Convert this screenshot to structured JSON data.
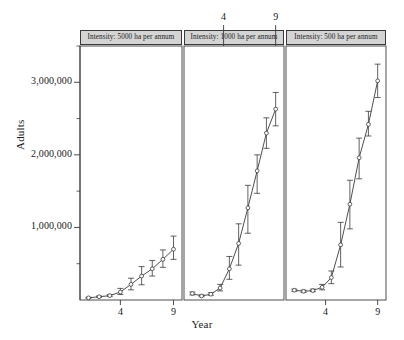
{
  "figure": {
    "axis_titles": {
      "y": "Adults",
      "x": "Year"
    },
    "colors": {
      "line": "#3a3a3a",
      "strip_fill": "#d4d4d4",
      "strip_border": "#3a3a3a",
      "text": "#1a1a1a"
    }
  },
  "chart_data": {
    "type": "line",
    "title": "",
    "xlabel": "Year",
    "ylabel": "Adults",
    "xlim": [
      0.2,
      9.8
    ],
    "ylim": [
      0,
      3500000
    ],
    "grid": false,
    "legend": "none",
    "layout": "3 panels side by side (trellis), shared y-axis",
    "error_bars": true,
    "marker": "open circle",
    "xticks": [
      4,
      9
    ],
    "xtick_labels": [
      "4",
      "9"
    ],
    "xtick_side_per_panel": [
      "bottom",
      "top",
      "bottom"
    ],
    "yticks": [
      1000000,
      2000000,
      3000000
    ],
    "ytick_labels": [
      "1,000,000",
      "2,000,000",
      "3,000,000"
    ],
    "yminor_ticks": [
      500000,
      1500000,
      2500000,
      3500000
    ],
    "panels": [
      {
        "strip_label": "Intensity: 5000 ha per annum",
        "x": [
          1,
          2,
          3,
          4,
          5,
          6,
          7,
          8,
          9
        ],
        "y": [
          30000,
          45000,
          60000,
          110000,
          215000,
          330000,
          430000,
          560000,
          700000
        ],
        "y_lower": [
          25000,
          38000,
          50000,
          75000,
          140000,
          210000,
          330000,
          450000,
          560000
        ],
        "y_upper": [
          38000,
          55000,
          75000,
          160000,
          300000,
          460000,
          545000,
          690000,
          880000
        ]
      },
      {
        "strip_label": "Intensity: 1000 ha per annum",
        "x": [
          1,
          2,
          3,
          4,
          5,
          6,
          7,
          8,
          9
        ],
        "y": [
          90000,
          55000,
          80000,
          165000,
          430000,
          780000,
          1270000,
          1780000,
          2300000,
          2630000
        ],
        "y_lower": [
          70000,
          45000,
          65000,
          125000,
          285000,
          480000,
          920000,
          1470000,
          2090000,
          2400000
        ],
        "y_upper": [
          110000,
          70000,
          100000,
          215000,
          600000,
          1050000,
          1580000,
          2000000,
          2510000,
          2860000
        ]
      },
      {
        "strip_label": "Intensity: 500 ha per annum",
        "x": [
          1,
          2,
          3,
          4,
          5,
          6,
          7,
          8,
          9
        ],
        "y": [
          135000,
          120000,
          130000,
          175000,
          310000,
          760000,
          1320000,
          1960000,
          2420000,
          3020000
        ],
        "y_lower": [
          120000,
          105000,
          115000,
          140000,
          225000,
          455000,
          980000,
          1670000,
          2260000,
          2790000
        ],
        "y_upper": [
          150000,
          135000,
          150000,
          215000,
          400000,
          1070000,
          1650000,
          2230000,
          2600000,
          3250000
        ]
      }
    ]
  }
}
